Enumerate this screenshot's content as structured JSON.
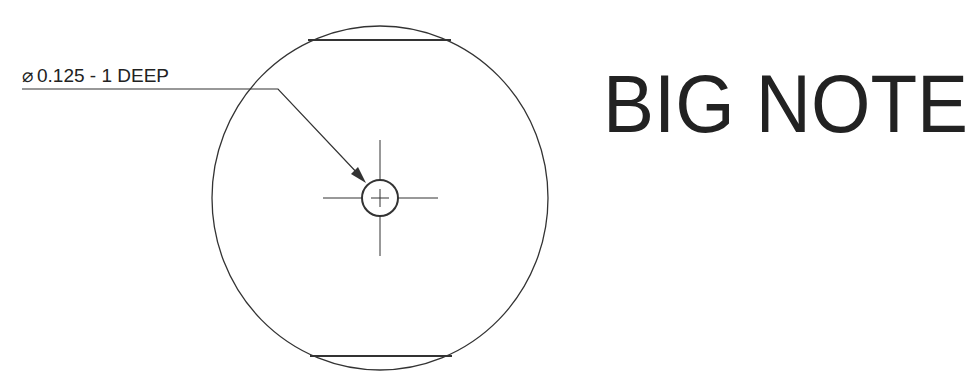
{
  "drawing": {
    "callout": {
      "symbol": "⌀",
      "text": "0.125 - 1 DEEP"
    },
    "big_note": "BIG NOTE",
    "colors": {
      "line": "#333333",
      "text": "#222222",
      "background": "#ffffff"
    }
  }
}
